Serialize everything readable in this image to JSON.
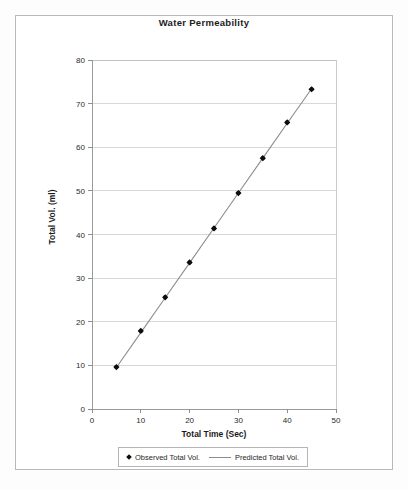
{
  "chart_data": {
    "type": "scatter",
    "title": "Water Permeability",
    "xlabel": "Total Time (Sec)",
    "ylabel": "Total Vol. (ml)",
    "xlim": [
      0,
      50
    ],
    "ylim": [
      0,
      80
    ],
    "xticks": [
      0,
      10,
      20,
      30,
      40,
      50
    ],
    "yticks": [
      0,
      10,
      20,
      30,
      40,
      50,
      60,
      70,
      80
    ],
    "grid": "horizontal",
    "legend_position": "bottom",
    "x": [
      5,
      10,
      15,
      20,
      25,
      30,
      35,
      40,
      45
    ],
    "series": [
      {
        "name": "Observed Total Vol.",
        "marker": "diamond",
        "color": "#0d0d0d",
        "values": [
          9.6,
          17.9,
          25.6,
          33.6,
          41.4,
          49.5,
          57.5,
          65.7,
          73.3
        ]
      },
      {
        "name": "Predicted Total Vol.",
        "marker": "line",
        "color": "#8c8c8c",
        "values": [
          9.5,
          17.5,
          25.5,
          33.5,
          41.5,
          49.5,
          57.5,
          65.5,
          73.4
        ]
      }
    ]
  },
  "legend": {
    "entries": [
      {
        "label": "Observed Total Vol."
      },
      {
        "label": "Predicted Total Vol."
      }
    ]
  }
}
